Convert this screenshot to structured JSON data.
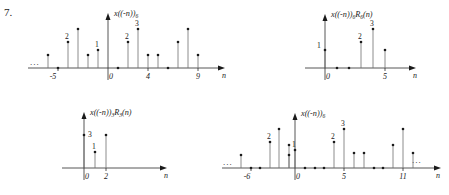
{
  "problem": {
    "number": "7."
  },
  "axis_name": "n",
  "ellipsis": "...",
  "plots": [
    {
      "id": "plot-top-left",
      "title": "x((-n))",
      "title_sub": "6",
      "title_tail": "",
      "xlabel": "n",
      "ylabel": "",
      "left_ellipsis": "...",
      "right_ellipsis": "",
      "xticks": [
        {
          "value": -5,
          "label": "-5"
        },
        {
          "value": 0,
          "label": "0"
        },
        {
          "value": 4,
          "label": "4"
        },
        {
          "value": 9,
          "label": "9"
        }
      ],
      "value_labels": [
        {
          "n": -3,
          "text": "2"
        },
        {
          "n": -1,
          "text": "1"
        },
        {
          "n": 2,
          "text": "2"
        },
        {
          "n": 3,
          "text": "3"
        }
      ],
      "stems": [
        {
          "n": -6,
          "v": 1
        },
        {
          "n": -5,
          "v": 0
        },
        {
          "n": -4,
          "v": 2
        },
        {
          "n": -3,
          "v": 3
        },
        {
          "n": -2,
          "v": 1
        },
        {
          "n": -1,
          "v": 1.4
        },
        {
          "n": 0,
          "v": 0
        },
        {
          "n": 1,
          "v": 2
        },
        {
          "n": 2,
          "v": 3
        },
        {
          "n": 3,
          "v": 1
        },
        {
          "n": 4,
          "v": 1
        },
        {
          "n": 5,
          "v": 0
        },
        {
          "n": 6,
          "v": 2
        },
        {
          "n": 7,
          "v": 3
        },
        {
          "n": 8,
          "v": 1
        }
      ]
    },
    {
      "id": "plot-top-right",
      "title": "x((-n))",
      "title_sub": "6",
      "title_tail": "R",
      "title_tail_sub": "6",
      "title_tail_end": "(n)",
      "xlabel": "n",
      "left_ellipsis": "",
      "right_ellipsis": "",
      "xticks": [
        {
          "value": 0,
          "label": "0"
        },
        {
          "value": 5,
          "label": "5"
        }
      ],
      "value_labels": [
        {
          "n": 0,
          "text": "1"
        },
        {
          "n": 3,
          "text": "2"
        },
        {
          "n": 4,
          "text": "3"
        }
      ],
      "stems": [
        {
          "n": 0,
          "v": 1.4
        },
        {
          "n": 1,
          "v": 0
        },
        {
          "n": 2,
          "v": 0
        },
        {
          "n": 3,
          "v": 2
        },
        {
          "n": 4,
          "v": 3
        },
        {
          "n": 5,
          "v": 1.4
        }
      ]
    },
    {
      "id": "plot-bottom-left",
      "title": "x((-n))",
      "title_sub": "3",
      "title_tail": "R",
      "title_tail_sub": "3",
      "title_tail_end": "(n)",
      "xlabel": "n",
      "left_ellipsis": "",
      "right_ellipsis": "",
      "xticks": [
        {
          "value": 0,
          "label": "0"
        },
        {
          "value": 2,
          "label": "2"
        }
      ],
      "value_labels": [
        {
          "n": 0,
          "text": "3"
        },
        {
          "n": 1,
          "text": "1"
        }
      ],
      "stems": [
        {
          "n": 0,
          "v": 3
        },
        {
          "n": 1,
          "v": 1.4
        },
        {
          "n": 2,
          "v": 3
        }
      ]
    },
    {
      "id": "plot-bottom-right",
      "title": "x((-n))",
      "title_sub": "6",
      "title_tail": "",
      "xlabel": "n",
      "left_ellipsis": "...",
      "right_ellipsis": "...",
      "xticks": [
        {
          "value": -6,
          "label": "-6"
        },
        {
          "value": 0,
          "label": "0"
        },
        {
          "value": 5,
          "label": "5"
        },
        {
          "value": 11,
          "label": "11"
        }
      ],
      "value_labels": [
        {
          "n": -4,
          "text": "2"
        },
        {
          "n": -1,
          "text": "1"
        },
        {
          "n": 3,
          "text": "2"
        },
        {
          "n": 4,
          "text": "3"
        }
      ],
      "stems": [
        {
          "n": -8,
          "v": 1
        },
        {
          "n": -7,
          "v": 0
        },
        {
          "n": -6,
          "v": 0
        },
        {
          "n": -5,
          "v": 0
        },
        {
          "n": -4,
          "v": 2
        },
        {
          "n": -3,
          "v": 3
        },
        {
          "n": -2,
          "v": 2
        },
        {
          "n": -2.6,
          "v": 0
        },
        {
          "n": -1,
          "v": 1.4
        },
        {
          "n": 0,
          "v": 0
        },
        {
          "n": 1,
          "v": 0
        },
        {
          "n": 2,
          "v": 0
        },
        {
          "n": 3,
          "v": 2
        },
        {
          "n": 4,
          "v": 3
        },
        {
          "n": 5,
          "v": 1.4
        },
        {
          "n": 6,
          "v": 1.4
        },
        {
          "n": 7,
          "v": 0
        },
        {
          "n": 8,
          "v": 0
        },
        {
          "n": 9,
          "v": 2
        },
        {
          "n": 10,
          "v": 3
        },
        {
          "n": 11,
          "v": 1.4
        }
      ]
    }
  ]
}
